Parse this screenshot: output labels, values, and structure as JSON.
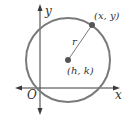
{
  "diagram": {
    "type": "circle-on-coordinate-plane",
    "colors": {
      "circle": "#7a7a7a",
      "axes": "#3a3a3a",
      "radius_line": "#6a6a6a",
      "points": "#555555",
      "text": "#333333"
    },
    "labels": {
      "y_axis": "y",
      "x_axis": "x",
      "origin": "O",
      "point_on_circle": "(x, y)",
      "center": "(h, k)",
      "radius": "r"
    }
  }
}
